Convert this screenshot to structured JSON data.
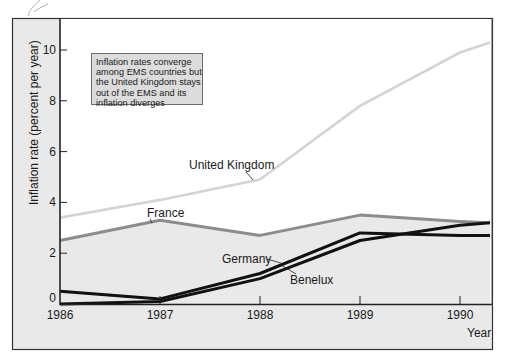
{
  "chart_data": {
    "type": "line",
    "title": "",
    "annotation": [
      "Inflation rates converge",
      "among EMS countries but",
      "the United Kingdom stays",
      "out of the EMS and its",
      "inflation diverges"
    ],
    "xlabel": "Year",
    "ylabel": "Inflation rate (percent per year)",
    "x": [
      1986,
      1987,
      1988,
      1989,
      1990,
      1990.3
    ],
    "x_ticks": [
      "1986",
      "1987",
      "1988",
      "1989",
      "1990"
    ],
    "y_ticks": [
      "0",
      "2",
      "4",
      "6",
      "8",
      "10"
    ],
    "ylim": [
      0,
      11.3
    ],
    "xlim": [
      1986,
      1990.32
    ],
    "grid": false,
    "legend": "inline labels",
    "series": [
      {
        "name": "United Kingdom",
        "color": "#d4d4d4",
        "width": 2.6,
        "values": [
          3.4,
          4.1,
          4.9,
          7.8,
          9.9,
          10.3
        ]
      },
      {
        "name": "France",
        "color": "#8c8c8c",
        "width": 3,
        "values": [
          2.5,
          3.3,
          2.7,
          3.5,
          3.25,
          3.2
        ]
      },
      {
        "name": "Germany",
        "color": "#111111",
        "width": 3,
        "values": [
          0.5,
          0.2,
          1.2,
          2.8,
          2.7,
          2.7
        ]
      },
      {
        "name": "Benelux",
        "color": "#111111",
        "width": 3,
        "values": [
          0.0,
          0.1,
          1.0,
          2.5,
          3.1,
          3.2
        ]
      }
    ],
    "area_fill": {
      "below_series": "France",
      "color": "#e9e9e9"
    }
  },
  "labels": {
    "united_kingdom": "United Kingdom",
    "france": "France",
    "germany": "Germany",
    "benelux": "Benelux"
  },
  "colors": {
    "frame_bg": "#e9e9e9",
    "plot_bg": "#ffffff",
    "axis": "#222222",
    "frame_border": "#333333"
  }
}
